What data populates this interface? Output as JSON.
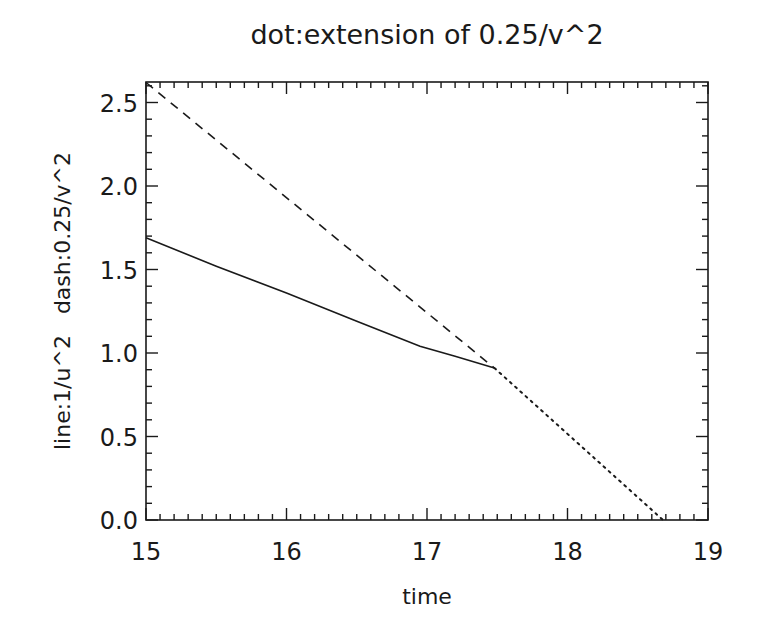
{
  "chart_data": {
    "type": "line",
    "title": "dot:extension of 0.25/v^2",
    "xlabel": "time",
    "ylabel": "line:1/u^2   dash:0.25/v^2",
    "xlim": [
      15,
      19
    ],
    "ylim": [
      0,
      2.62
    ],
    "xticks": [
      15,
      16,
      17,
      18,
      19
    ],
    "xtick_labels": [
      "15",
      "16",
      "17",
      "18",
      "19"
    ],
    "yticks": [
      0.0,
      0.5,
      1.0,
      1.5,
      2.0,
      2.5
    ],
    "ytick_labels": [
      "0.0",
      "0.5",
      "1.0",
      "1.5",
      "2.0",
      "2.5"
    ],
    "x_minor_per_major": 10,
    "y_minor_per_major": 5,
    "grid": false,
    "legend": null,
    "series": [
      {
        "name": "line:1/u^2",
        "style": "solid",
        "x": [
          15.0,
          15.5,
          16.0,
          16.5,
          16.95,
          17.2,
          17.48
        ],
        "y": [
          1.69,
          1.52,
          1.36,
          1.19,
          1.04,
          0.98,
          0.91
        ]
      },
      {
        "name": "dash:0.25/v^2",
        "style": "dashed",
        "x": [
          15.0,
          17.48
        ],
        "y": [
          2.62,
          0.91
        ]
      },
      {
        "name": "dot:extension of 0.25/v^2",
        "style": "dotted",
        "x": [
          17.48,
          18.68
        ],
        "y": [
          0.91,
          0.0
        ]
      }
    ]
  },
  "plot_area": {
    "left": 146,
    "right": 708,
    "top": 82,
    "bottom": 520
  },
  "colors": {
    "foreground": "#1a1a1a",
    "background": "#ffffff"
  }
}
